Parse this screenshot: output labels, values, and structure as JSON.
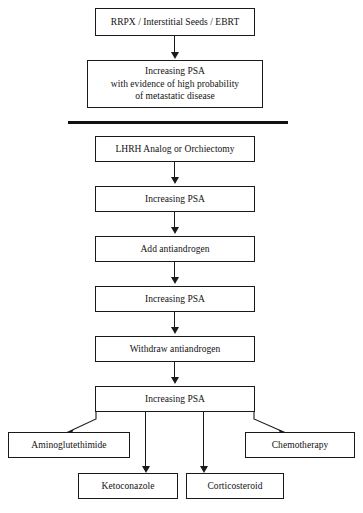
{
  "diagram": {
    "type": "flowchart",
    "background_color": "#ffffff",
    "line_color": "#1a1a1a",
    "text_color": "#111111",
    "sections": [
      {
        "name": "localized-disease",
        "nodes": [
          "initial-therapy",
          "psa-rise-metastatic"
        ]
      },
      {
        "name": "hormonal-therapy",
        "nodes": [
          "lhrh-orchiectomy",
          "psa-rise-1",
          "add-antiandrogen",
          "psa-rise-2",
          "withdraw-antiandrogen",
          "psa-rise-3"
        ]
      },
      {
        "name": "secondary-options",
        "nodes": [
          "aminoglutethimide",
          "ketoconazole",
          "corticosteroid",
          "chemotherapy"
        ]
      }
    ],
    "nodes": {
      "initial_therapy": {
        "label": "RRPX / Interstitial Seeds / EBRT"
      },
      "psa_rise_metastatic": {
        "line1": "Increasing PSA",
        "line2": "with evidence of high probability",
        "line3": "of metastatic disease"
      },
      "lhrh_orchiectomy": {
        "label": "LHRH Analog or Orchiectomy"
      },
      "psa_rise_1": {
        "label": "Increasing PSA"
      },
      "add_antiandrogen": {
        "label": "Add antiandrogen"
      },
      "psa_rise_2": {
        "label": "Increasing PSA"
      },
      "withdraw_antiandrogen": {
        "label": "Withdraw antiandrogen"
      },
      "psa_rise_3": {
        "label": "Increasing PSA"
      },
      "aminoglutethimide": {
        "label": "Aminoglutethimide"
      },
      "ketoconazole": {
        "label": "Ketoconazole"
      },
      "corticosteroid": {
        "label": "Corticosteroid"
      },
      "chemotherapy": {
        "label": "Chemotherapy"
      }
    }
  }
}
